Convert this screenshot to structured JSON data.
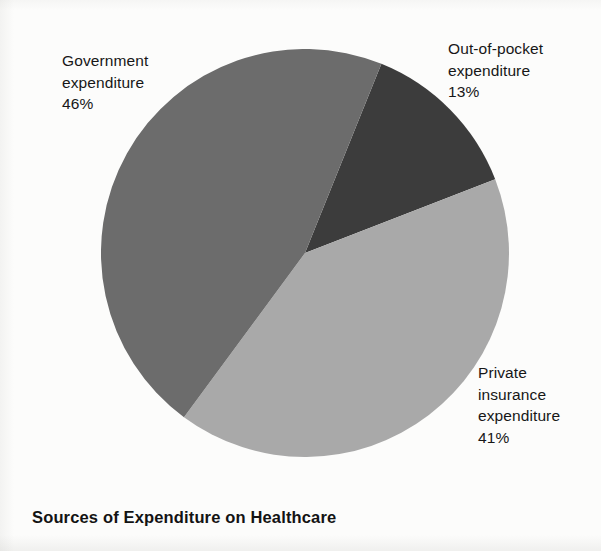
{
  "chart_data": {
    "type": "pie",
    "title": "Sources of Expenditure on Healthcare",
    "xlabel": "",
    "ylabel": "",
    "legend_position": "callout-labels",
    "grid": false,
    "categories": [
      "Out-of-pocket expenditure",
      "Private insurance expenditure",
      "Government expenditure"
    ],
    "values": [
      13,
      41,
      46
    ],
    "unit": "%",
    "start_angle_deg": 22,
    "direction": "clockwise",
    "slices": [
      {
        "name": "out-of-pocket",
        "label": "Out-of-pocket\nexpenditure\n13%",
        "value": 13,
        "value_text": "13%",
        "color": "#3c3c3c"
      },
      {
        "name": "private-insurance",
        "label": "Private\ninsurance\nexpenditure\n41%",
        "value": 41,
        "value_text": "41%",
        "color": "#a9a9a9"
      },
      {
        "name": "government",
        "label": "Government\nexpenditure\n46%",
        "value": 46,
        "value_text": "46%",
        "color": "#6c6c6c"
      }
    ]
  },
  "figure": {
    "title": "Sources of Expenditure on Healthcare",
    "background_color": "#fbfbfa",
    "text_color": "#171717"
  }
}
